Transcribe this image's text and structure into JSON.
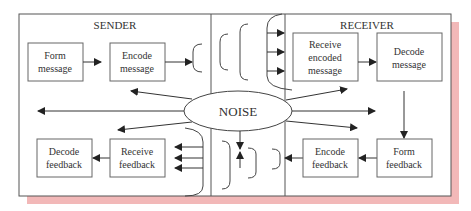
{
  "colors": {
    "line": "#333333",
    "box": "#555555",
    "shadow": "#f2b8b8",
    "background": "#ffffff"
  },
  "sections": {
    "sender": "SENDER",
    "receiver": "RECEIVER"
  },
  "noise": {
    "label": "NOISE"
  },
  "boxes": {
    "form_message": [
      "Form",
      "message"
    ],
    "encode_message": [
      "Encode",
      "message"
    ],
    "receive_encoded": [
      "Receive",
      "encoded",
      "message"
    ],
    "decode_message": [
      "Decode",
      "message"
    ],
    "decode_feedback": [
      "Decode",
      "feedback"
    ],
    "receive_feedback": [
      "Receive",
      "feedback"
    ],
    "encode_feedback": [
      "Encode",
      "feedback"
    ],
    "form_feedback": [
      "Form",
      "feedback"
    ]
  }
}
